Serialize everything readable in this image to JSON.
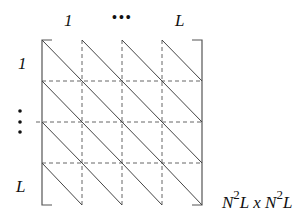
{
  "diagram": {
    "column_labels": [
      "1",
      "•••",
      "L"
    ],
    "row_labels": [
      "1",
      "⋮",
      "L"
    ],
    "size_label": {
      "base1": "N",
      "exp1": "2",
      "mid": "L x ",
      "base2": "N",
      "exp2": "2",
      "end": "L"
    },
    "grid": {
      "rows": 4,
      "cols": 4,
      "x0": 42,
      "y0": 40,
      "cell_w": 40,
      "cell_h": 41.25
    },
    "colors": {
      "line": "#555555",
      "dash": "#666666",
      "text": "#111111"
    }
  }
}
